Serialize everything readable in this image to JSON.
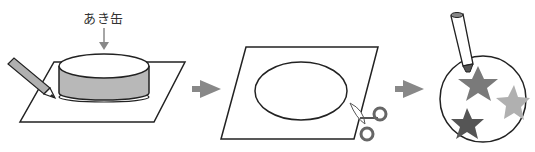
{
  "steps": [
    {
      "id": "trace",
      "label": "あき缶",
      "description": "Trace around an empty can with a pencil on paper"
    },
    {
      "id": "cut",
      "description": "Cut out the traced circle with scissors"
    },
    {
      "id": "decorate",
      "description": "Decorate the circle with stars using a marker"
    }
  ],
  "colors": {
    "outline": "#222222",
    "arrow": "#888888",
    "can_side": "#b8b8b8",
    "star_dark": "#555555",
    "star_mid": "#7a7a7a",
    "star_light": "#b0b0b0"
  }
}
